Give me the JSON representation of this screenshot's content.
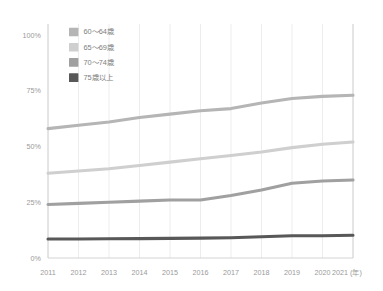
{
  "chart_data": {
    "type": "line",
    "title": "",
    "subtitle": "",
    "xlabel": "",
    "ylabel": "",
    "grid": "vertical-only",
    "legend_position": "top-left-inside",
    "xlim": [
      2011,
      2021
    ],
    "ylim": [
      0,
      100
    ],
    "x": [
      2011,
      2012,
      2013,
      2014,
      2015,
      2016,
      2017,
      2018,
      2019,
      2020,
      2021
    ],
    "categories": [
      "2011",
      "2012",
      "2013",
      "2014",
      "2015",
      "2016",
      "2017",
      "2018",
      "2019",
      "2020",
      "2021"
    ],
    "ytick_labels": [
      "0%",
      "25%",
      "50%",
      "75%",
      "100%"
    ],
    "ytick_values": [
      0,
      25,
      50,
      75,
      100
    ],
    "xtick_labels": [
      "2011",
      "2012",
      "2013",
      "2014",
      "2015",
      "2016",
      "2017",
      "2018",
      "2019",
      "2020",
      "2021 (年)"
    ],
    "x_unit_note": "(年)",
    "series": [
      {
        "name": "60〜64歳",
        "color": "#b5b5b5",
        "values": [
          58.0,
          59.5,
          61.0,
          63.0,
          64.5,
          66.0,
          67.0,
          69.5,
          71.5,
          72.5,
          73.0
        ]
      },
      {
        "name": "65〜69歳",
        "color": "#cfcfcf",
        "values": [
          38.0,
          39.0,
          40.0,
          41.5,
          43.0,
          44.5,
          46.0,
          47.5,
          49.5,
          51.0,
          52.0
        ]
      },
      {
        "name": "70〜74歳",
        "color": "#a0a0a0",
        "values": [
          24.0,
          24.5,
          25.0,
          25.5,
          26.0,
          26.0,
          28.0,
          30.5,
          33.5,
          34.5,
          35.0
        ]
      },
      {
        "name": "75歳以上",
        "color": "#585858",
        "values": [
          8.5,
          8.5,
          8.6,
          8.7,
          8.8,
          8.9,
          9.1,
          9.5,
          10.0,
          10.0,
          10.2
        ]
      }
    ]
  },
  "legend": {
    "items": [
      {
        "label": "60〜64歳",
        "color": "#b5b5b5"
      },
      {
        "label": "65〜69歳",
        "color": "#cfcfcf"
      },
      {
        "label": "70〜74歳",
        "color": "#a0a0a0"
      },
      {
        "label": "75歳以上",
        "color": "#585858"
      }
    ]
  },
  "axes": {
    "y_labels": [
      "100%",
      "75%",
      "50%",
      "25%",
      "0%"
    ],
    "x_labels": [
      "2011",
      "2012",
      "2013",
      "2014",
      "2015",
      "2016",
      "2017",
      "2018",
      "2019",
      "2020",
      "2021 (年)"
    ]
  },
  "colors": {
    "grid": "#e8e8e8",
    "axis": "#cfcfcf",
    "tick_text": "#9a9a9a",
    "legend_text": "#7d7d7d",
    "background": "#ffffff"
  }
}
